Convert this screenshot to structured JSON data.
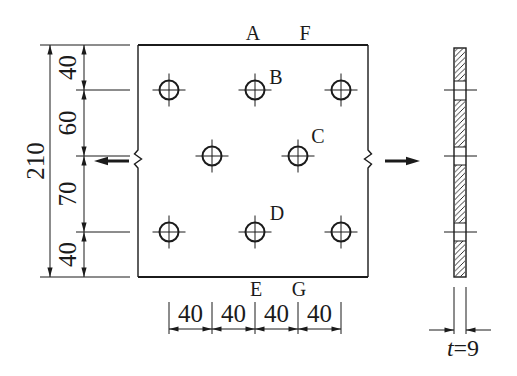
{
  "colors": {
    "ink": "#1b1b1b",
    "background": "#ffffff"
  },
  "plate": {
    "point_labels": {
      "A": "A",
      "B": "B",
      "C": "C",
      "D": "D",
      "E": "E",
      "F": "F",
      "G": "G"
    },
    "hole_count": 8
  },
  "dimensions": {
    "overall_height": "210",
    "vertical_segments": [
      "40",
      "60",
      "70",
      "40"
    ],
    "horizontal_segments": [
      "40",
      "40",
      "40",
      "40"
    ],
    "thickness": {
      "symbol": "t",
      "value": "=9"
    }
  }
}
